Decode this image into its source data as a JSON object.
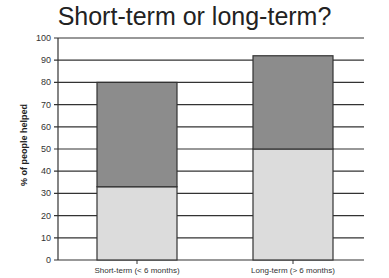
{
  "chart_data": {
    "type": "bar",
    "stacked": true,
    "title": "Short-term or long-term?",
    "xlabel": "",
    "ylabel": "% of people helped",
    "ylim": [
      0,
      100
    ],
    "yticks": [
      0,
      10,
      20,
      30,
      40,
      50,
      60,
      70,
      80,
      90,
      100
    ],
    "grid": true,
    "categories": [
      "Short-term (< 6 months)",
      "Long-term (> 6 months)"
    ],
    "series": [
      {
        "name": "lower",
        "color": "#dcdcdc",
        "values": [
          33,
          50
        ]
      },
      {
        "name": "upper",
        "color": "#8c8c8c",
        "values": [
          47,
          42
        ]
      }
    ],
    "totals": [
      80,
      92
    ]
  }
}
